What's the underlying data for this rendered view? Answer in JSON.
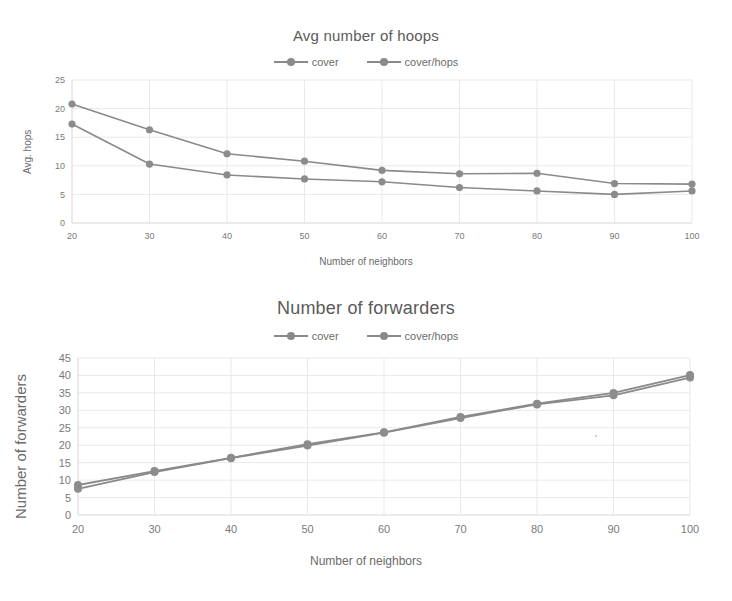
{
  "charts": [
    {
      "title": "Avg number of hoops",
      "xlabel": "Number of neighbors",
      "ylabel": "Avg. hops",
      "legend": [
        "cover",
        "cover/hops"
      ]
    },
    {
      "title": "Number of forwarders",
      "xlabel": "Number of neighbors",
      "ylabel": "Number of forwarders",
      "legend": [
        "cover",
        "cover/hops"
      ]
    }
  ],
  "colors": {
    "series": "#8a8a8a",
    "grid": "#e9e9e9",
    "axis": "#d6d6d6",
    "text": "#6b6b6b",
    "background": "#ffffff"
  },
  "chart_data": [
    {
      "type": "line",
      "title": "Avg number of hoops",
      "xlabel": "Number of neighbors",
      "ylabel": "Avg. hops",
      "x": [
        20,
        30,
        40,
        50,
        60,
        70,
        80,
        90,
        100
      ],
      "xticks": [
        "20",
        "30",
        "40",
        "50",
        "60",
        "70",
        "80",
        "90",
        "100"
      ],
      "yticks": [
        "0",
        "5",
        "10",
        "15",
        "20",
        "25"
      ],
      "xlim": [
        20,
        100
      ],
      "ylim": [
        0,
        25
      ],
      "grid": true,
      "legend_position": "top-center",
      "series": [
        {
          "name": "cover",
          "values": [
            20.8,
            16.3,
            12.1,
            10.8,
            9.2,
            8.6,
            8.7,
            6.9,
            6.8
          ]
        },
        {
          "name": "cover/hops",
          "values": [
            17.3,
            10.3,
            8.4,
            7.7,
            7.2,
            6.2,
            5.6,
            5.0,
            5.6
          ]
        }
      ]
    },
    {
      "type": "line",
      "title": "Number of forwarders",
      "xlabel": "Number of neighbors",
      "ylabel": "Number of forwarders",
      "x": [
        20,
        30,
        40,
        50,
        60,
        70,
        80,
        90,
        100
      ],
      "xticks": [
        "20",
        "30",
        "40",
        "50",
        "60",
        "70",
        "80",
        "90",
        "100"
      ],
      "yticks": [
        "0",
        "5",
        "10",
        "15",
        "20",
        "25",
        "30",
        "35",
        "40",
        "45"
      ],
      "xlim": [
        20,
        100
      ],
      "ylim": [
        0,
        45
      ],
      "grid": true,
      "legend_position": "top-center",
      "series": [
        {
          "name": "cover",
          "values": [
            8.6,
            12.6,
            16.4,
            20.3,
            23.7,
            28.1,
            31.9,
            35.0,
            40.1
          ]
        },
        {
          "name": "cover/hops",
          "values": [
            7.5,
            12.3,
            16.3,
            19.9,
            23.6,
            27.8,
            31.7,
            34.3,
            39.4
          ]
        }
      ]
    }
  ]
}
